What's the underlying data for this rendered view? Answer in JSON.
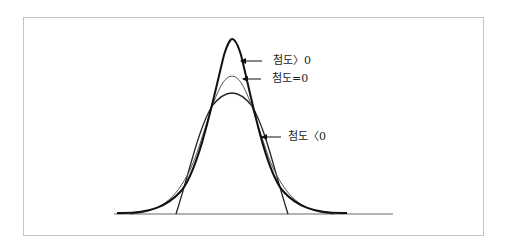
{
  "figure": {
    "labels": {
      "positive": "첨도〉0",
      "zero": "첨도=0",
      "negative": "첨도〈0"
    }
  },
  "diagram": {
    "type": "kurtosis-comparison",
    "curves": [
      {
        "name": "leptokurtic",
        "label": "첨도〉0",
        "peak_y": 40,
        "stroke": "#111111",
        "width": 2
      },
      {
        "name": "mesokurtic",
        "label": "첨도=0",
        "peak_y": 75,
        "stroke": "#555555",
        "width": 1
      },
      {
        "name": "platykurtic",
        "label": "첨도〈0",
        "peak_y": 93,
        "stroke": "#222222",
        "width": 1.4
      }
    ],
    "baseline": {
      "y": 214,
      "x1": 114,
      "x2": 393
    },
    "colors": {
      "frame": "#c4c4c4",
      "baseline": "#9a9a9a",
      "arrow": "#111111"
    }
  }
}
